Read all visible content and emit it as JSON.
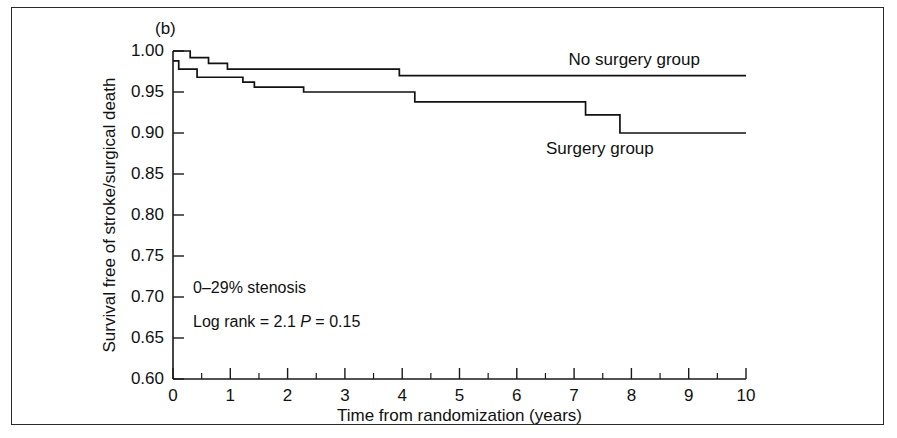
{
  "figure": {
    "panel_label": "(b)",
    "border_color": "#2b2b2b",
    "background": "#ffffff"
  },
  "annotations": {
    "stenosis": "0–29% stenosis",
    "logrank_label": "Log rank = 2.1",
    "p_italic": "P",
    "p_value": " = 0.15"
  },
  "chart_data": {
    "type": "line",
    "subtype": "kaplan-meier-step",
    "title": "",
    "xlabel": "Time from randomization (years)",
    "ylabel": "Survival free of stroke/surgical death",
    "xlim": [
      0,
      10
    ],
    "ylim": [
      0.6,
      1.0
    ],
    "xticks": [
      0,
      1,
      2,
      3,
      4,
      5,
      6,
      7,
      8,
      9,
      10
    ],
    "xtick_labels": [
      "0",
      "1",
      "2",
      "3",
      "4",
      "5",
      "6",
      "7",
      "8",
      "9",
      "10"
    ],
    "xminor_ticks": [
      0.5,
      1.5,
      2.5,
      3.5,
      4.5,
      5.5,
      6.5,
      7.5,
      8.5,
      9.5
    ],
    "yticks": [
      0.6,
      0.65,
      0.7,
      0.75,
      0.8,
      0.85,
      0.9,
      0.95,
      1.0
    ],
    "ytick_labels": [
      "0.60",
      "0.65",
      "0.70",
      "0.75",
      "0.80",
      "0.85",
      "0.90",
      "0.95",
      "1.00"
    ],
    "grid": false,
    "legend_position": "inline-annotation",
    "line_color": "#111111",
    "series": [
      {
        "name": "No surgery group",
        "label_x": 8.05,
        "label_y": 0.983,
        "steps": [
          [
            0.0,
            1.0
          ],
          [
            0.3,
            1.0
          ],
          [
            0.3,
            0.992
          ],
          [
            0.62,
            0.992
          ],
          [
            0.62,
            0.985
          ],
          [
            0.95,
            0.985
          ],
          [
            0.95,
            0.978
          ],
          [
            3.95,
            0.978
          ],
          [
            3.95,
            0.97
          ],
          [
            10.0,
            0.97
          ]
        ]
      },
      {
        "name": "Surgery group",
        "label_x": 7.45,
        "label_y": 0.875,
        "steps": [
          [
            0.0,
            0.988
          ],
          [
            0.1,
            0.988
          ],
          [
            0.1,
            0.978
          ],
          [
            0.42,
            0.978
          ],
          [
            0.42,
            0.968
          ],
          [
            1.22,
            0.968
          ],
          [
            1.22,
            0.962
          ],
          [
            1.42,
            0.962
          ],
          [
            1.42,
            0.956
          ],
          [
            2.28,
            0.956
          ],
          [
            2.28,
            0.95
          ],
          [
            4.22,
            0.95
          ],
          [
            4.22,
            0.938
          ],
          [
            7.2,
            0.938
          ],
          [
            7.2,
            0.922
          ],
          [
            7.8,
            0.922
          ],
          [
            7.8,
            0.9
          ],
          [
            10.0,
            0.9
          ]
        ]
      }
    ]
  }
}
